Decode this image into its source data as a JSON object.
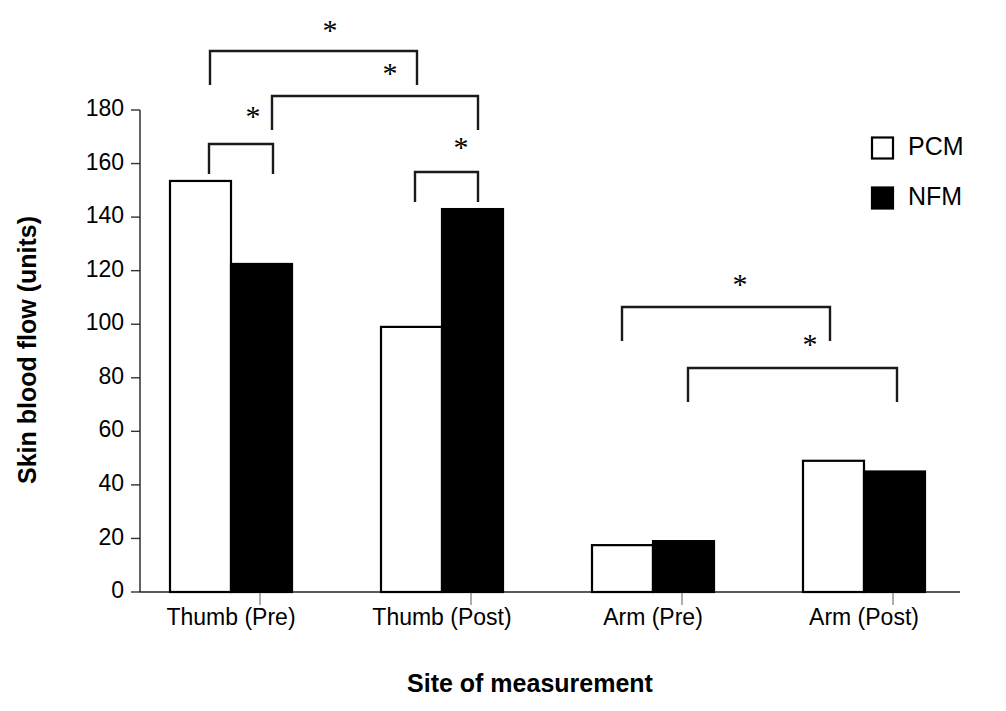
{
  "chart_data": {
    "type": "bar",
    "title": "",
    "subtitle": "",
    "xlabel": "Site of measurement",
    "ylabel": "Skin blood flow (units)",
    "categories": [
      "Thumb (Pre)",
      "Thumb (Post)",
      "Arm (Pre)",
      "Arm (Post)"
    ],
    "series": [
      {
        "name": "PCM",
        "values": [
          153.5,
          99,
          17.5,
          49
        ],
        "fill": "#ffffff",
        "stroke": "#000000"
      },
      {
        "name": "NFM",
        "values": [
          122.5,
          143,
          19,
          45
        ],
        "fill": "#000000",
        "stroke": "#000000"
      }
    ],
    "ylim": [
      0,
      180
    ],
    "yticks": [
      0,
      20,
      40,
      60,
      80,
      100,
      120,
      140,
      160,
      180
    ],
    "ytick_labels": [
      "0",
      "20",
      "40",
      "60",
      "80",
      "100",
      "120",
      "140",
      "160",
      "180"
    ],
    "grid": false,
    "legend_position": "top-right",
    "legend": [
      {
        "label": "PCM",
        "marker": "open-square"
      },
      {
        "label": "NFM",
        "marker": "filled-square"
      }
    ],
    "annotations": [
      {
        "id": "sig-1",
        "symbol": "*",
        "type": "significance-bracket",
        "from": "Thumb (Pre) PCM",
        "to": "Thumb (Post) PCM"
      },
      {
        "id": "sig-2",
        "symbol": "*",
        "type": "significance-bracket",
        "from": "Thumb (Pre) NFM",
        "to": "Thumb (Post) NFM"
      },
      {
        "id": "sig-3",
        "symbol": "*",
        "type": "significance-bracket",
        "from": "Thumb (Pre) PCM",
        "to": "Thumb (Pre) NFM"
      },
      {
        "id": "sig-4",
        "symbol": "*",
        "type": "significance-bracket",
        "from": "Thumb (Post) PCM",
        "to": "Thumb (Post) NFM"
      },
      {
        "id": "sig-5",
        "symbol": "*",
        "type": "significance-bracket",
        "from": "Arm (Pre) PCM",
        "to": "Arm (Post) PCM"
      },
      {
        "id": "sig-6",
        "symbol": "*",
        "type": "significance-bracket",
        "from": "Arm (Pre) NFM",
        "to": "Arm (Post) NFM"
      }
    ]
  },
  "geometry": {
    "plot": {
      "x0": 140,
      "y0": 110,
      "baseline_y": 592,
      "px_per_unit": 2.6778
    },
    "bars": [
      {
        "name": "thumb-pre-pcm",
        "x": 170,
        "w": 61,
        "series": "PCM",
        "category": "Thumb (Pre)"
      },
      {
        "name": "thumb-pre-nfm",
        "x": 231,
        "w": 61,
        "series": "NFM",
        "category": "Thumb (Pre)"
      },
      {
        "name": "thumb-post-pcm",
        "x": 381,
        "w": 61,
        "series": "PCM",
        "category": "Thumb (Post)"
      },
      {
        "name": "thumb-post-nfm",
        "x": 442,
        "w": 61,
        "series": "NFM",
        "category": "Thumb (Post)"
      },
      {
        "name": "arm-pre-pcm",
        "x": 592,
        "w": 61,
        "series": "PCM",
        "category": "Arm (Pre)"
      },
      {
        "name": "arm-pre-nfm",
        "x": 653,
        "w": 61,
        "series": "NFM",
        "category": "Arm (Pre)"
      },
      {
        "name": "arm-post-pcm",
        "x": 803,
        "w": 61,
        "series": "PCM",
        "category": "Arm (Post)"
      },
      {
        "name": "arm-post-nfm",
        "x": 864,
        "w": 61,
        "series": "NFM",
        "category": "Arm (Post)"
      }
    ],
    "category_label_x": [
      231,
      442,
      653,
      864
    ],
    "category_label_y": 625,
    "separator_ticks_x": [
      260,
      471,
      682,
      893
    ],
    "brackets": [
      {
        "id": "sig-1",
        "x1": 210,
        "x2": 417,
        "y": 51,
        "drop_left": 34,
        "drop_right": 34,
        "star_x": 330,
        "star_y": 33
      },
      {
        "id": "sig-2",
        "x1": 272,
        "x2": 478,
        "y": 96,
        "drop_left": 34,
        "drop_right": 34,
        "star_x": 390,
        "star_y": 76
      },
      {
        "id": "sig-3",
        "x1": 209,
        "x2": 273,
        "y": 144,
        "drop_left": 30,
        "drop_right": 30,
        "star_x": 253,
        "star_y": 119
      },
      {
        "id": "sig-4",
        "x1": 415,
        "x2": 478,
        "y": 172,
        "drop_left": 30,
        "drop_right": 30,
        "star_x": 461,
        "star_y": 150
      },
      {
        "id": "sig-5",
        "x1": 622,
        "x2": 830,
        "y": 307,
        "drop_left": 34,
        "drop_right": 34,
        "star_x": 740,
        "star_y": 287
      },
      {
        "id": "sig-6",
        "x1": 688,
        "x2": 897,
        "y": 368,
        "drop_left": 34,
        "drop_right": 34,
        "star_x": 810,
        "star_y": 347
      }
    ],
    "legend": {
      "x": 872,
      "y_pcm": 148,
      "y_nfm": 198,
      "swatch": 21,
      "label_x": 908
    },
    "ylabel_pos": {
      "x": 36,
      "y": 350
    },
    "xlabel_pos": {
      "x": 530,
      "y": 692
    }
  }
}
